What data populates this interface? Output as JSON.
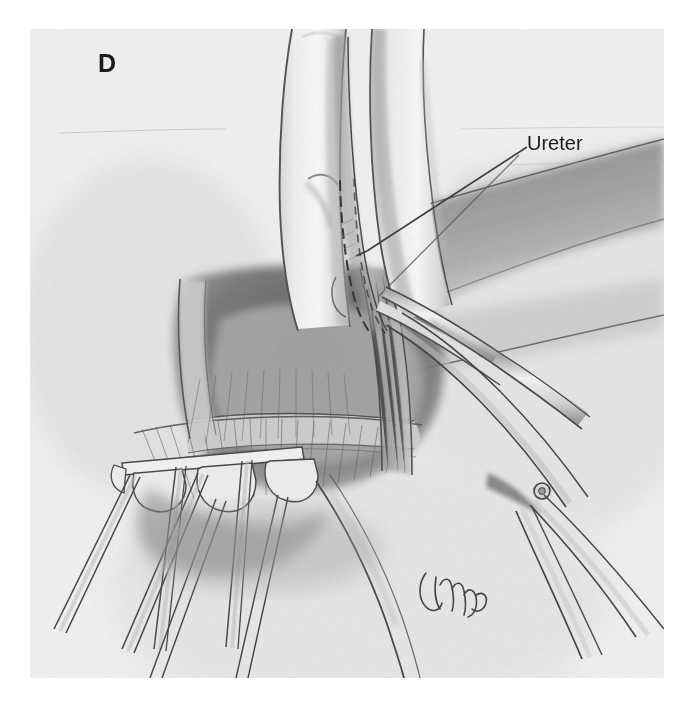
{
  "figure": {
    "panel_letter": "D",
    "kind": "medical-surgical-illustration",
    "medium": "graphite pencil drawing on textured paper",
    "background_color": "#f3f3f3",
    "ink_color": "#3a3a3a",
    "text_color": "#1d1d1d"
  },
  "annotations": [
    {
      "id": "ureter",
      "label": "Ureter",
      "leader": "diagonal line from label down-left to the dashed ureter between the fingers"
    }
  ],
  "scene": {
    "description": "Surgeon's index and middle finger palpate tissue; the ureter is shown as a dashed line running in the groove between the fingers. Curved dissecting scissors enter from the lower right toward the tissue; rake retractors hold the incision open at the lower left.",
    "elements": [
      {
        "name": "index-finger",
        "note": "upper left finger of the palpating hand"
      },
      {
        "name": "middle-finger",
        "note": "upper right finger of the palpating hand"
      },
      {
        "name": "ureter-dashed-line",
        "note": "dashed outline of the ureter between the fingertips"
      },
      {
        "name": "dissecting-scissors",
        "note": "curved scissors with visible hinge screw, entering from lower right"
      },
      {
        "name": "scissors-hinge-screw",
        "note": "small circular screw at the scissor joint"
      },
      {
        "name": "rake-retractor-left",
        "note": "toothed retractor blade at lower left holding tissue"
      },
      {
        "name": "rake-retractor-right",
        "note": "second toothed retractor blade"
      },
      {
        "name": "retractor-shafts",
        "note": "thin parallel handles running to the lower left corner"
      },
      {
        "name": "dissected-tissue-bed",
        "note": "shaded surgical field with cut fascial edges"
      },
      {
        "name": "retracted-tissue-band",
        "note": "dark shaded tissue band sweeping across the upper right"
      },
      {
        "name": "artist-signature",
        "note": "cursive signature in the lower middle area"
      }
    ]
  }
}
